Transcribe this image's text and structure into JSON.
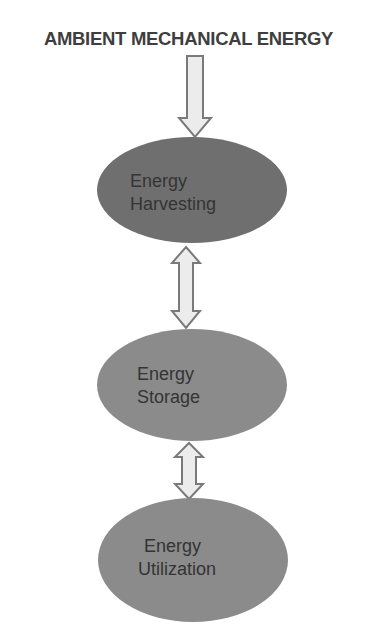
{
  "title": "AMBIENT MECHANICAL ENERGY",
  "nodes": [
    {
      "line1": "Energy",
      "line2": "Harvesting",
      "fill": "#6f6f6f"
    },
    {
      "line1": "Energy",
      "line2": "Storage",
      "fill": "#8b8b8b"
    },
    {
      "line1": "Energy",
      "line2": "Utilization",
      "fill": "#8b8b8b"
    }
  ],
  "arrows": [
    {
      "from": "AMBIENT MECHANICAL ENERGY",
      "to": "Energy Harvesting",
      "type": "single-down"
    },
    {
      "from": "Energy Harvesting",
      "to": "Energy Storage",
      "type": "bidirectional"
    },
    {
      "from": "Energy Storage",
      "to": "Energy Utilization",
      "type": "bidirectional"
    }
  ],
  "colors": {
    "arrow_fill": "#ececec",
    "arrow_stroke": "#7a7a7a",
    "text": "#343434"
  }
}
